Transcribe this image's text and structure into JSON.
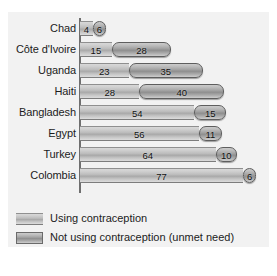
{
  "chart_data": {
    "type": "bar",
    "orientation": "horizontal",
    "stacked": true,
    "title": "",
    "subtitle": "",
    "xlabel": "",
    "ylabel": "",
    "grid": false,
    "legend_position": "bottom-left",
    "xlim": [
      0,
      85
    ],
    "categories": [
      "Chad",
      "Côte d'Ivoire",
      "Uganda",
      "Haiti",
      "Bangladesh",
      "Egypt",
      "Turkey",
      "Colombia"
    ],
    "series": [
      {
        "name": "Using contraception",
        "color": "#bdbdbd",
        "values": [
          4,
          15,
          23,
          28,
          54,
          56,
          64,
          77
        ]
      },
      {
        "name": "Not using contraception (unmet need)",
        "color": "#8f8f8f",
        "values": [
          6,
          28,
          35,
          40,
          15,
          11,
          10,
          6
        ]
      }
    ]
  },
  "legend": {
    "items": [
      {
        "label": "Using contraception"
      },
      {
        "label": "Not using contraception (unmet need)"
      }
    ]
  }
}
